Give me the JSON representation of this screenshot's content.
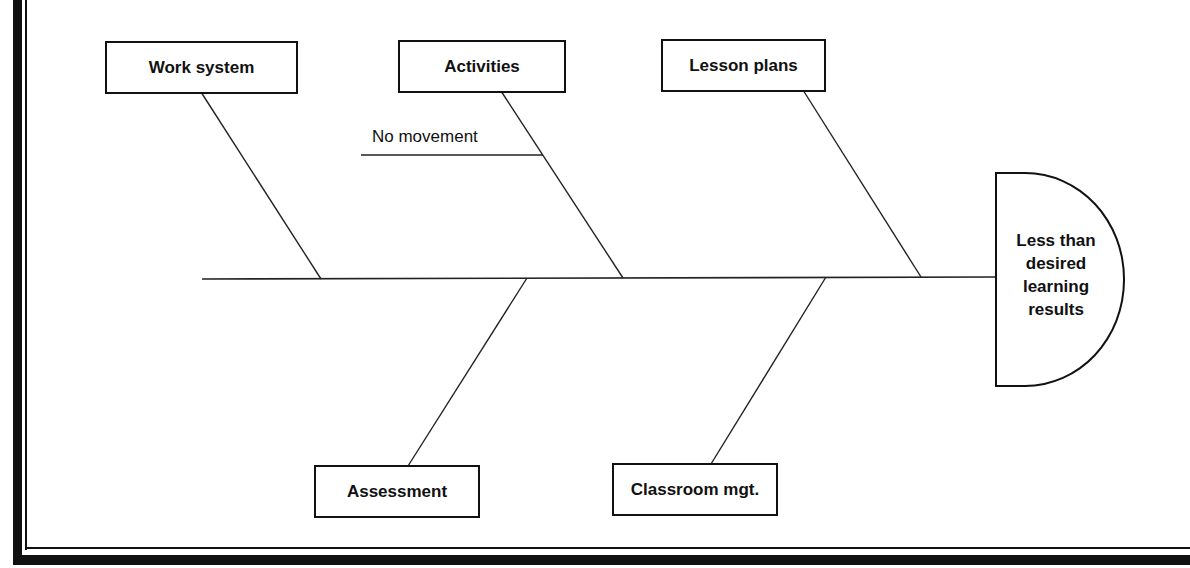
{
  "diagram": {
    "type": "fishbone",
    "effect": "Less than desired learning results",
    "causes_top": [
      {
        "label": "Work system",
        "sub_causes": []
      },
      {
        "label": "Activities",
        "sub_causes": [
          "No movement"
        ]
      },
      {
        "label": "Lesson plans",
        "sub_causes": []
      }
    ],
    "causes_bottom": [
      {
        "label": "Assessment",
        "sub_causes": []
      },
      {
        "label": "Classroom mgt.",
        "sub_causes": []
      }
    ]
  },
  "colors": {
    "line": "#111111",
    "background": "#ffffff"
  }
}
